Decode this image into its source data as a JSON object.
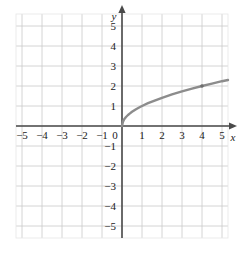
{
  "chart_data": {
    "type": "line",
    "title": "",
    "subtitle": "",
    "xlabel": "x",
    "ylabel": "y",
    "xlim": [
      -5.3,
      5.3
    ],
    "ylim": [
      -5.6,
      5.6
    ],
    "grid": true,
    "grid_step": 1,
    "legend": "none",
    "function": "y = sqrt(x)",
    "x_tick_labels": [
      "−5",
      "−4",
      "−3",
      "−2",
      "−1",
      "0",
      "1",
      "2",
      "3",
      "4",
      "5"
    ],
    "x_tick_values": [
      -5,
      -4,
      -3,
      -2,
      -1,
      0,
      1,
      2,
      3,
      4,
      5
    ],
    "y_tick_labels": [
      "5",
      "4",
      "3",
      "2",
      "1",
      "−1",
      "−2",
      "−3",
      "−4",
      "−5"
    ],
    "y_tick_values": [
      5,
      4,
      3,
      2,
      1,
      -1,
      -2,
      -3,
      -4,
      -5
    ],
    "origin_label": "0",
    "series": [
      {
        "name": "y = sqrt(x)",
        "color": "#8c8c8c",
        "x": [
          0,
          0.05,
          0.1,
          0.2,
          0.3,
          0.4,
          0.5,
          0.7,
          0.9,
          1,
          1.3,
          1.6,
          2,
          2.5,
          3,
          3.5,
          4,
          4.5,
          5,
          5.3
        ],
        "values": [
          0,
          0.22,
          0.32,
          0.45,
          0.55,
          0.63,
          0.71,
          0.84,
          0.95,
          1,
          1.14,
          1.26,
          1.41,
          1.58,
          1.73,
          1.87,
          2,
          2.12,
          2.24,
          2.3
        ]
      }
    ],
    "markers": [
      {
        "x": 4,
        "y": 2,
        "label": ""
      }
    ],
    "colors": {
      "curve": "#8c8c8c",
      "axis": "#4a4a4a",
      "grid_major": "#c9c9c9",
      "grid_minor": "#e6e6e6",
      "text": "#1a1a1a",
      "background": "#ffffff"
    }
  }
}
